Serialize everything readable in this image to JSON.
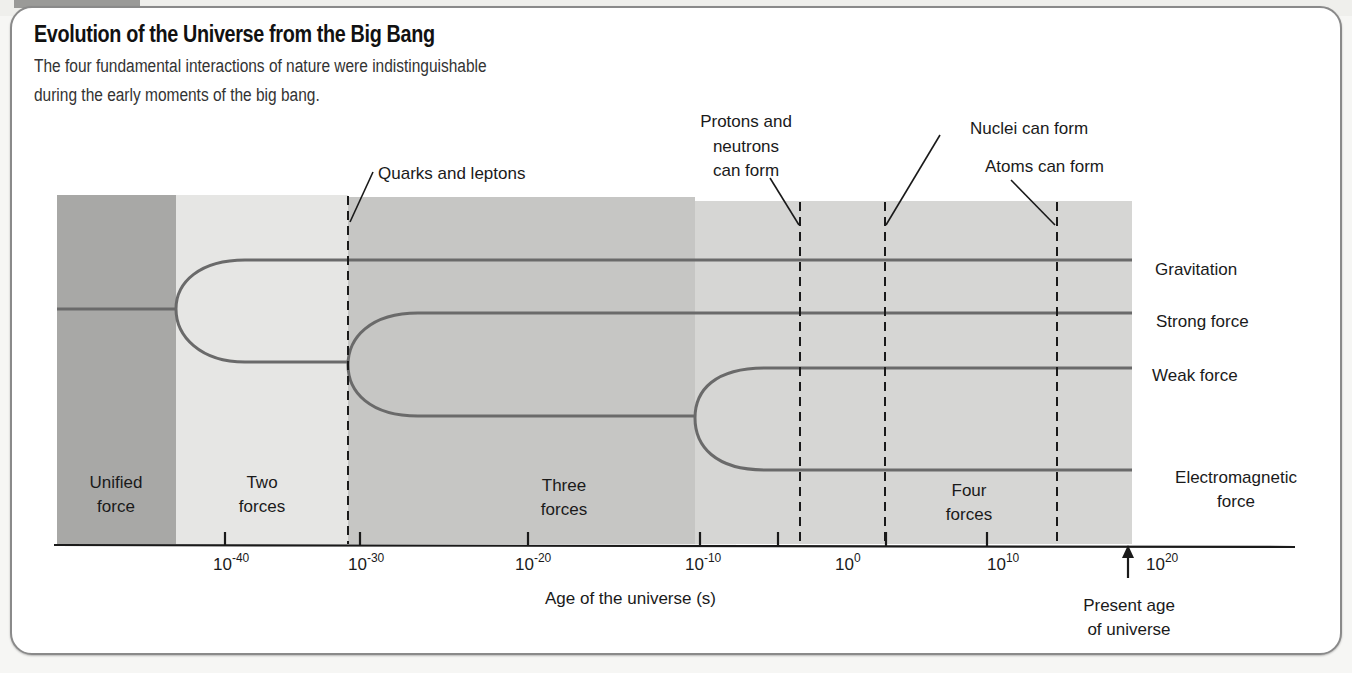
{
  "figure": {
    "title": "Evolution of the Universe from the Big Bang",
    "subtitle_lines": [
      "The four fundamental interactions of nature were indistinguishable",
      "during the early moments of the big bang."
    ]
  },
  "colors": {
    "unified_region": "#a8a8a6",
    "two_forces_region": "#e6e6e4",
    "three_forces_region": "#c6c6c4",
    "four_forces_region": "#d6d6d4",
    "force_lines": "#6a6a6a",
    "axis": "#1a1a1a"
  },
  "regions": [
    {
      "label_line1": "Unified",
      "label_line2": "force"
    },
    {
      "label_line1": "Two",
      "label_line2": "forces"
    },
    {
      "label_line1": "Three",
      "label_line2": "forces"
    },
    {
      "label_line1": "Four",
      "label_line2": "forces"
    }
  ],
  "forces": [
    {
      "label_line1": "Gravitation",
      "label_line2": ""
    },
    {
      "label_line1": "Strong force",
      "label_line2": ""
    },
    {
      "label_line1": "Weak force",
      "label_line2": ""
    },
    {
      "label_line1": "Electromagnetic",
      "label_line2": "force"
    }
  ],
  "events": [
    {
      "label_lines": [
        "Quarks and leptons"
      ]
    },
    {
      "label_lines": [
        "Protons and",
        "neutrons",
        "can form"
      ]
    },
    {
      "label_lines": [
        "Nuclei can form"
      ]
    },
    {
      "label_lines": [
        "Atoms can form"
      ]
    }
  ],
  "axis": {
    "title": "Age of the universe (s)",
    "ticks": [
      {
        "base": "10",
        "exp": "-40"
      },
      {
        "base": "10",
        "exp": "-30"
      },
      {
        "base": "10",
        "exp": "-20"
      },
      {
        "base": "10",
        "exp": "-10"
      },
      {
        "base": "10",
        "exp": "0"
      },
      {
        "base": "10",
        "exp": "10"
      },
      {
        "base": "10",
        "exp": "20"
      }
    ],
    "marker": {
      "label_line1": "Present age",
      "label_line2": "of universe"
    }
  }
}
